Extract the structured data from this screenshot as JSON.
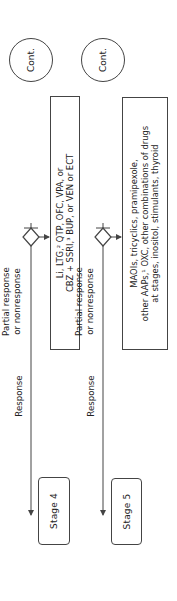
{
  "diagram": {
    "orientation": "rotated-90-ccw",
    "stages": [
      {
        "label": "Stage 4",
        "treatment": {
          "line1": "Li, LTG,² QTP, OFC, VPA, or",
          "line2": "CBZ + SSRI,³ BUP, or VEN or ECT"
        },
        "branch_label_1": "Partial response",
        "branch_label_2": "or nonresponse",
        "response_label": "Response",
        "outcome": "Cont."
      },
      {
        "label": "Stage 5",
        "treatment": {
          "line1": "MAOIs, tricyclics, pramipexole,",
          "line2": "other AAPs,¹ OXC, other combinations of drugs",
          "line3": "at stages, inositol, stimulants, thyroid"
        },
        "branch_label_1": "Partial response",
        "branch_label_2": "or nonresponse",
        "response_label": "Response",
        "outcome": "Cont."
      }
    ],
    "colors": {
      "line": "#444444",
      "background": "#ffffff",
      "text": "#222222"
    }
  }
}
